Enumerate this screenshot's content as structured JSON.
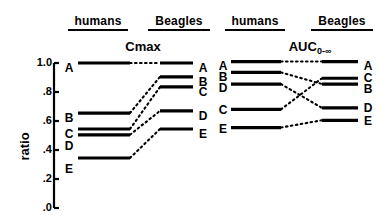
{
  "headers": {
    "left_panel": {
      "humans": "humans",
      "beagles": "Beagles"
    },
    "right_panel": {
      "humans": "humans",
      "beagles": "Beagles"
    }
  },
  "axis": {
    "ylabel": "ratio",
    "ticks": [
      "1.0",
      ".8",
      ".6",
      ".4",
      ".2",
      ".0"
    ],
    "tick_values": [
      1.0,
      0.8,
      0.6,
      0.4,
      0.2,
      0.0
    ]
  },
  "chart_data": [
    {
      "type": "line",
      "title": "Cmax",
      "title_main": "Cmax",
      "title_sub": "",
      "xlabel": "",
      "ylabel": "ratio",
      "ylim": [
        0.0,
        1.0
      ],
      "grid": false,
      "legend": "none",
      "categories": [
        "humans",
        "Beagles"
      ],
      "annotations": [
        "A",
        "B",
        "C",
        "D",
        "E"
      ],
      "series": [
        {
          "name": "A",
          "values": [
            1.0,
            1.0
          ]
        },
        {
          "name": "B",
          "values": [
            0.655,
            0.905
          ]
        },
        {
          "name": "C",
          "values": [
            0.545,
            0.835
          ]
        },
        {
          "name": "D",
          "values": [
            0.505,
            0.67
          ]
        },
        {
          "name": "E",
          "values": [
            0.345,
            0.545
          ]
        }
      ],
      "left_order": [
        "A",
        "B",
        "C",
        "D",
        "E"
      ],
      "right_order": [
        "A",
        "B",
        "C",
        "D",
        "E"
      ]
    },
    {
      "type": "line",
      "title": "AUC0-∞",
      "title_main": "AUC",
      "title_sub": "0-∞",
      "xlabel": "",
      "ylabel": "ratio",
      "ylim": [
        0.0,
        1.0
      ],
      "grid": false,
      "legend": "none",
      "categories": [
        "humans",
        "Beagles"
      ],
      "annotations": [
        "A",
        "B",
        "C",
        "D",
        "E"
      ],
      "series": [
        {
          "name": "A",
          "values": [
            1.01,
            1.01
          ]
        },
        {
          "name": "B",
          "values": [
            0.935,
            0.855
          ]
        },
        {
          "name": "C",
          "values": [
            0.68,
            0.895
          ]
        },
        {
          "name": "D",
          "values": [
            0.855,
            0.69
          ]
        },
        {
          "name": "E",
          "values": [
            0.555,
            0.605
          ]
        }
      ],
      "left_order": [
        "A",
        "B",
        "D",
        "C",
        "E"
      ],
      "right_order": [
        "A",
        "C",
        "B",
        "D",
        "E"
      ]
    }
  ]
}
